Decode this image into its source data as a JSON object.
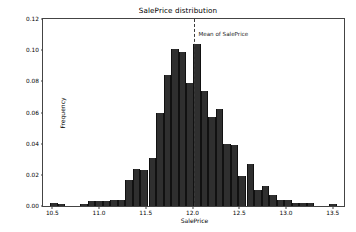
{
  "chart_data": {
    "type": "bar",
    "title": "SalePrice distribution",
    "xlabel": "SalePrice",
    "ylabel": "Frequency",
    "xlim": [
      10.4,
      13.62
    ],
    "ylim": [
      0.0,
      0.12
    ],
    "grid": false,
    "legend_position": "none",
    "bin_width": 0.0805,
    "xticks": [
      "10.5",
      "11.0",
      "11.5",
      "12.0",
      "12.5",
      "13.0",
      "13.5"
    ],
    "xtick_values": [
      10.5,
      11.0,
      11.5,
      12.0,
      12.5,
      13.0,
      13.5
    ],
    "yticks": [
      "0.00",
      "0.02",
      "0.04",
      "0.06",
      "0.08",
      "0.10",
      "0.12"
    ],
    "ytick_values": [
      0.0,
      0.02,
      0.04,
      0.06,
      0.08,
      0.1,
      0.12
    ],
    "bar_color": "#2f2f2f",
    "annotations": [
      {
        "name": "mean-of-saleprice",
        "label": "Mean of SalePrice",
        "x": 12.02,
        "line_style": "dashed",
        "line_color": "#3a3a3a"
      }
    ],
    "x": [
      10.44,
      10.52,
      10.6,
      10.68,
      10.76,
      10.84,
      10.92,
      11.0,
      11.08,
      11.16,
      11.24,
      11.32,
      11.4,
      11.48,
      11.57,
      11.65,
      11.73,
      11.81,
      11.89,
      11.97,
      12.05,
      12.13,
      12.21,
      12.29,
      12.37,
      12.45,
      12.53,
      12.62,
      12.7,
      12.78,
      12.86,
      12.94,
      13.02,
      13.1,
      13.18,
      13.26,
      13.34,
      13.42,
      13.5
    ],
    "values": [
      0.0,
      0.002,
      0.001,
      0.0,
      0.0,
      0.001,
      0.003,
      0.003,
      0.003,
      0.004,
      0.004,
      0.017,
      0.024,
      0.023,
      0.031,
      0.06,
      0.084,
      0.101,
      0.099,
      0.079,
      0.104,
      0.074,
      0.057,
      0.062,
      0.04,
      0.039,
      0.019,
      0.027,
      0.01,
      0.013,
      0.007,
      0.004,
      0.004,
      0.002,
      0.002,
      0.002,
      0.0,
      0.0,
      0.001
    ]
  }
}
